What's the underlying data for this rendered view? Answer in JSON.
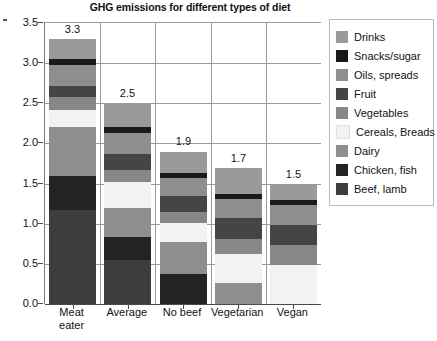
{
  "chart_data": {
    "type": "bar",
    "subtype": "stacked-bar",
    "title": "GHG emissions for different types of diet",
    "xlabel": "",
    "ylabel": "",
    "ylim": [
      0.0,
      3.5
    ],
    "yticks": [
      "0.0",
      "0.5",
      "1.0",
      "1.5",
      "2.0",
      "2.5",
      "3.0",
      "3.5"
    ],
    "ytick_values": [
      0.0,
      0.5,
      1.0,
      1.5,
      2.0,
      2.5,
      3.0,
      3.5
    ],
    "grid": true,
    "legend_position": "right",
    "categories": [
      "Meat eater",
      "Average",
      "No beef",
      "Vegetarian",
      "Vegan"
    ],
    "category_lines": [
      [
        "Meat",
        "eater"
      ],
      [
        "Average"
      ],
      [
        "No beef"
      ],
      [
        "Vegetarian"
      ],
      [
        "Vegan"
      ]
    ],
    "totals": [
      3.3,
      2.5,
      1.9,
      1.7,
      1.5
    ],
    "total_labels": [
      "3.3",
      "2.5",
      "1.9",
      "1.7",
      "1.5"
    ],
    "series": [
      {
        "name": "Beef, lamb",
        "color": "#3d3d3d",
        "values": [
          1.17,
          0.55,
          0.0,
          0.0,
          0.0
        ]
      },
      {
        "name": "Chicken, fish",
        "color": "#232323",
        "values": [
          0.42,
          0.29,
          0.38,
          0.0,
          0.0
        ]
      },
      {
        "name": "Dairy",
        "color": "#8e8e8e",
        "values": [
          0.61,
          0.36,
          0.39,
          0.26,
          0.0
        ]
      },
      {
        "name": "Cereals, Breads",
        "color": "#f2f2f2",
        "values": [
          0.22,
          0.32,
          0.24,
          0.36,
          0.49
        ]
      },
      {
        "name": "Vegetables",
        "color": "#878787",
        "values": [
          0.16,
          0.15,
          0.14,
          0.19,
          0.24
        ]
      },
      {
        "name": "Fruit",
        "color": "#454545",
        "values": [
          0.13,
          0.2,
          0.2,
          0.26,
          0.25
        ]
      },
      {
        "name": "Oils, spreads",
        "color": "#8e8e8e",
        "values": [
          0.27,
          0.26,
          0.22,
          0.24,
          0.25
        ]
      },
      {
        "name": "Snacks/sugar",
        "color": "#1a1a1a",
        "values": [
          0.07,
          0.07,
          0.06,
          0.06,
          0.06
        ]
      },
      {
        "name": "Drinks",
        "color": "#9a9a9a",
        "values": [
          0.25,
          0.3,
          0.27,
          0.33,
          0.21
        ]
      }
    ]
  },
  "legend": {
    "items": [
      {
        "label": "Drinks",
        "color": "#9a9a9a"
      },
      {
        "label": "Snacks/sugar",
        "color": "#1a1a1a"
      },
      {
        "label": "Oils, spreads",
        "color": "#8e8e8e"
      },
      {
        "label": "Fruit",
        "color": "#454545"
      },
      {
        "label": "Vegetables",
        "color": "#878787"
      },
      {
        "label": "Cereals, Breads",
        "color": "#f2f2f2"
      },
      {
        "label": "Dairy",
        "color": "#8e8e8e"
      },
      {
        "label": "Chicken, fish",
        "color": "#232323"
      },
      {
        "label": "Beef, lamb",
        "color": "#3d3d3d"
      }
    ]
  }
}
